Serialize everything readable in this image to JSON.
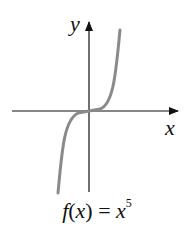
{
  "diagram": {
    "axes": {
      "x_label": "x",
      "y_label": "y"
    },
    "caption": {
      "func": "f",
      "arg": "x",
      "equals": "=",
      "base": "x",
      "exponent": "5"
    },
    "curve_color": "#8a8a8a",
    "axis_color": "#111111"
  }
}
